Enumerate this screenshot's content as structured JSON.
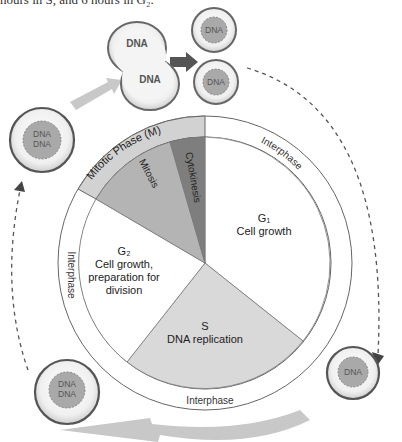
{
  "caption": "hours in S, and 6 hours in G₂.",
  "diagram": {
    "outer_ring_labels": {
      "mitotic": "Mitotic Phase (M)",
      "interphase_right": "Interphase",
      "interphase_left": "Interphase",
      "interphase_bottom": "Interphase"
    },
    "segments": {
      "mitosis": "Mitosis",
      "cytokinesis": "Cytokinesis",
      "g1_name": "G₁",
      "g1_desc": "Cell growth",
      "s_name": "S",
      "s_desc": "DNA replication",
      "g2_name": "G₂",
      "g2_desc_1": "Cell growth,",
      "g2_desc_2": "preparation for",
      "g2_desc_3": "division"
    },
    "cells": {
      "dividing_top": "DNA",
      "dividing_bottom": "DNA",
      "daughter_1": "DNA",
      "daughter_2": "DNA",
      "g1_cell": "DNA",
      "s_cell_1": "DNA",
      "s_cell_2": "DNA",
      "g2_cell_1": "DNA",
      "g2_cell_2": "DNA"
    },
    "colors": {
      "mitotic_ring": "#d2d2d2",
      "mitosis": "#b4b4b4",
      "cytokinesis": "#7e7e7e",
      "s_phase": "#d9d9d9",
      "g_phase": "#ffffff",
      "nucleus": "#a9a9a9",
      "arrow_light": "#c8c8c8",
      "arrow_dark": "#555555"
    }
  }
}
